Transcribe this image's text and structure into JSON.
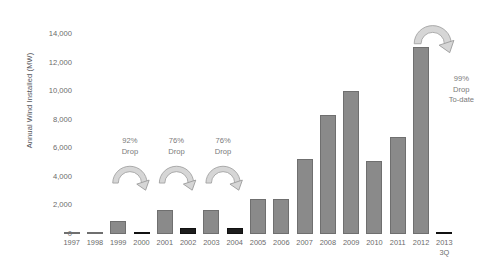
{
  "chart_data": {
    "type": "bar",
    "title": "",
    "xlabel": "",
    "ylabel": "Annual Wind Installed (MW)",
    "ylim": [
      0,
      15000
    ],
    "grid": false,
    "legend": "none",
    "ytick_labels": [
      "14,000",
      "12,000",
      "10,000",
      "8,000",
      "6,000",
      "4,000",
      "2,000",
      "0"
    ],
    "ytick_values": [
      14000,
      12000,
      10000,
      8000,
      6000,
      4000,
      2000,
      0
    ],
    "categories": [
      "1997",
      "1998",
      "1999",
      "2000",
      "2001",
      "2002",
      "2003",
      "2004",
      "2005",
      "2006",
      "2007",
      "2008",
      "2009",
      "2010",
      "2011",
      "2012",
      "2013"
    ],
    "category_sublabels": [
      "",
      "",
      "",
      "",
      "",
      "",
      "",
      "",
      "",
      "",
      "",
      "",
      "",
      "",
      "",
      "",
      "3Q"
    ],
    "values": [
      80,
      140,
      900,
      70,
      1700,
      410,
      1690,
      390,
      2430,
      2450,
      5250,
      8360,
      9990,
      5120,
      6820,
      13130,
      110
    ],
    "bar_styles": [
      "normal",
      "normal",
      "normal",
      "dark",
      "normal",
      "dark",
      "normal",
      "dark",
      "normal",
      "normal",
      "normal",
      "normal",
      "normal",
      "normal",
      "normal",
      "normal",
      "dark"
    ],
    "colors": {
      "bar": "#8a8a8a",
      "bar_highlight": "#1d1d1d",
      "text": "#6b6b6b",
      "arrow": "#d6d6d6",
      "arrow_outline": "#9a9a9a"
    },
    "annotations": [
      {
        "line1": "92%",
        "line2": "Drop",
        "line3": "",
        "from": "1999",
        "to": "2000"
      },
      {
        "line1": "76%",
        "line2": "Drop",
        "line3": "",
        "from": "2001",
        "to": "2002"
      },
      {
        "line1": "76%",
        "line2": "Drop",
        "line3": "",
        "from": "2003",
        "to": "2004"
      },
      {
        "line1": "99%",
        "line2": "Drop",
        "line3": "To-date",
        "from": "2012",
        "to": "2013"
      }
    ]
  }
}
